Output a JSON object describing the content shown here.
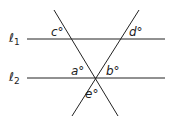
{
  "diagram": {
    "lines": {
      "l1": {
        "label_base": "ℓ",
        "label_sub": "1"
      },
      "l2": {
        "label_base": "ℓ",
        "label_sub": "2"
      }
    },
    "angles": {
      "a": "a°",
      "b": "b°",
      "c": "c°",
      "d": "d°",
      "e": "e°"
    },
    "colors": {
      "stroke": "#222222",
      "background": "#ffffff"
    }
  }
}
